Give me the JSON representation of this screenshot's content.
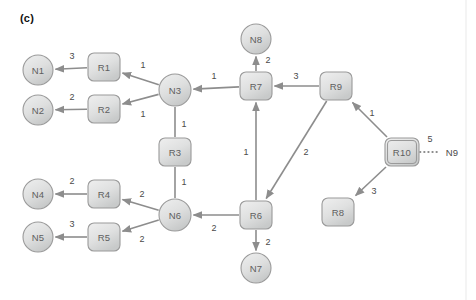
{
  "figure": {
    "panel_label": "(c)",
    "colors": {
      "node_fill_light": "#eceded",
      "node_fill_dark": "#c9cbcb",
      "node_stroke": "#9a9a9a",
      "edge_stroke": "#8d8d8d",
      "text": "#5e5e5e",
      "weight_text": "#4a4a4a",
      "background": "#ffffff"
    }
  },
  "chart_data": {
    "type": "diagram",
    "title": "(c)",
    "subtype": "directed-weighted-graph",
    "nodes": [
      {
        "id": "N1",
        "label": "N1",
        "shape": "circle",
        "cx": 38,
        "cy": 70,
        "r": 15
      },
      {
        "id": "N2",
        "label": "N2",
        "shape": "circle",
        "cx": 38,
        "cy": 110,
        "r": 15
      },
      {
        "id": "N4",
        "label": "N4",
        "shape": "circle",
        "cx": 38,
        "cy": 194,
        "r": 15
      },
      {
        "id": "N5",
        "label": "N5",
        "shape": "circle",
        "cx": 38,
        "cy": 237,
        "r": 15
      },
      {
        "id": "N3",
        "label": "N3",
        "shape": "circle",
        "cx": 175,
        "cy": 90,
        "r": 16
      },
      {
        "id": "N6",
        "label": "N6",
        "shape": "circle",
        "cx": 175,
        "cy": 215,
        "r": 16
      },
      {
        "id": "N7",
        "label": "N7",
        "shape": "circle",
        "cx": 256,
        "cy": 268,
        "r": 15
      },
      {
        "id": "N8",
        "label": "N8",
        "shape": "circle",
        "cx": 256,
        "cy": 39,
        "r": 15
      },
      {
        "id": "N9",
        "label": "N9",
        "shape": "text",
        "cx": 452,
        "cy": 152
      },
      {
        "id": "R1",
        "label": "R1",
        "shape": "rect",
        "x": 88,
        "y": 53,
        "w": 32,
        "h": 28
      },
      {
        "id": "R2",
        "label": "R2",
        "shape": "rect",
        "x": 88,
        "y": 95,
        "w": 32,
        "h": 28
      },
      {
        "id": "R3",
        "label": "R3",
        "shape": "rect",
        "x": 159,
        "y": 138,
        "w": 32,
        "h": 28
      },
      {
        "id": "R4",
        "label": "R4",
        "shape": "rect",
        "x": 88,
        "y": 180,
        "w": 32,
        "h": 28
      },
      {
        "id": "R5",
        "label": "R5",
        "shape": "rect",
        "x": 88,
        "y": 223,
        "w": 32,
        "h": 28
      },
      {
        "id": "R6",
        "label": "R6",
        "shape": "rect",
        "x": 240,
        "y": 201,
        "w": 32,
        "h": 28
      },
      {
        "id": "R7",
        "label": "R7",
        "shape": "rect",
        "x": 240,
        "y": 72,
        "w": 32,
        "h": 28
      },
      {
        "id": "R8",
        "label": "R8",
        "shape": "rect",
        "x": 322,
        "y": 198,
        "w": 32,
        "h": 28
      },
      {
        "id": "R9",
        "label": "R9",
        "shape": "rect",
        "x": 320,
        "y": 72,
        "w": 32,
        "h": 28
      },
      {
        "id": "R10",
        "label": "R10",
        "shape": "rect",
        "x": 385,
        "y": 138,
        "w": 34,
        "h": 28,
        "double_border": true
      }
    ],
    "edges": [
      {
        "from": "R1",
        "to": "N1",
        "weight": "3",
        "style": "arrow",
        "label_x": 72,
        "label_y": 56
      },
      {
        "from": "R2",
        "to": "N2",
        "weight": "2",
        "style": "arrow",
        "label_x": 72,
        "label_y": 97
      },
      {
        "from": "N3",
        "to": "R1",
        "weight": "1",
        "style": "arrow",
        "label_x": 143,
        "label_y": 65
      },
      {
        "from": "N3",
        "to": "R2",
        "weight": "1",
        "style": "arrow",
        "label_x": 143,
        "label_y": 114
      },
      {
        "from": "N3",
        "to": "R3",
        "weight": "1",
        "style": "plain",
        "label_x": 184,
        "label_y": 124
      },
      {
        "from": "R3",
        "to": "N6",
        "weight": "1",
        "style": "plain",
        "label_x": 184,
        "label_y": 182
      },
      {
        "from": "R4",
        "to": "N4",
        "weight": "2",
        "style": "arrow",
        "label_x": 72,
        "label_y": 181
      },
      {
        "from": "R5",
        "to": "N5",
        "weight": "3",
        "style": "arrow",
        "label_x": 72,
        "label_y": 224
      },
      {
        "from": "N6",
        "to": "R4",
        "weight": "2",
        "style": "arrow",
        "label_x": 142,
        "label_y": 194
      },
      {
        "from": "N6",
        "to": "R5",
        "weight": "2",
        "style": "arrow",
        "label_x": 142,
        "label_y": 239
      },
      {
        "from": "R6",
        "to": "N6",
        "weight": "2",
        "style": "arrow",
        "label_x": 214,
        "label_y": 228
      },
      {
        "from": "R6",
        "to": "N7",
        "weight": "2",
        "style": "arrow",
        "label_x": 268,
        "label_y": 242
      },
      {
        "from": "R6",
        "to": "R7",
        "weight": "1",
        "style": "arrow",
        "label_x": 246,
        "label_y": 152
      },
      {
        "from": "R7",
        "to": "N8",
        "weight": "2",
        "style": "arrow",
        "label_x": 268,
        "label_y": 60
      },
      {
        "from": "R7",
        "to": "N3",
        "weight": "1",
        "style": "arrow",
        "label_x": 214,
        "label_y": 76
      },
      {
        "from": "R9",
        "to": "R7",
        "weight": "3",
        "style": "arrow",
        "label_x": 296,
        "label_y": 76
      },
      {
        "from": "R9",
        "to": "R6",
        "weight": "2",
        "style": "arrow",
        "label_x": 306,
        "label_y": 152
      },
      {
        "from": "R10",
        "to": "R9",
        "weight": "1",
        "style": "arrow",
        "label_x": 372,
        "label_y": 113
      },
      {
        "from": "R10",
        "to": "R8",
        "weight": "3",
        "style": "arrow",
        "label_x": 374,
        "label_y": 191
      },
      {
        "from": "R10",
        "to": "N9",
        "weight": "5",
        "style": "dotted",
        "label_x": 430,
        "label_y": 139
      }
    ]
  }
}
